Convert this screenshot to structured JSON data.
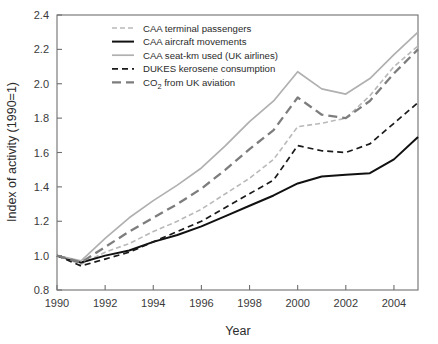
{
  "chart_data": {
    "type": "line",
    "title": "",
    "xlabel": "Year",
    "ylabel": "Index of activity (1990=1)",
    "xlim": [
      1990,
      2005
    ],
    "ylim": [
      0.8,
      2.4
    ],
    "grid": false,
    "legend_position": "top-left",
    "x": [
      1990,
      1991,
      1992,
      1993,
      1994,
      1995,
      1996,
      1997,
      1998,
      1999,
      2000,
      2001,
      2002,
      2003,
      2004,
      2005
    ],
    "xticks": [
      "1990",
      "1992",
      "1994",
      "1996",
      "1998",
      "2000",
      "2002",
      "2004"
    ],
    "xtick_values": [
      1990,
      1992,
      1994,
      1996,
      1998,
      2000,
      2002,
      2004
    ],
    "yticks": [
      "0.8",
      "1.0",
      "1.2",
      "1.4",
      "1.6",
      "1.8",
      "2.0",
      "2.2",
      "2.4"
    ],
    "ytick_values": [
      0.8,
      1.0,
      1.2,
      1.4,
      1.6,
      1.8,
      2.0,
      2.2,
      2.4
    ],
    "series": [
      {
        "name": "CAA terminal passengers",
        "style": "dashed",
        "color": "#b9b9b9",
        "width": 1.6,
        "dash": "5,3",
        "values": [
          1.0,
          0.95,
          1.02,
          1.07,
          1.14,
          1.2,
          1.27,
          1.36,
          1.45,
          1.56,
          1.75,
          1.77,
          1.8,
          1.93,
          2.1,
          2.22
        ]
      },
      {
        "name": "CAA aircraft movements",
        "style": "solid",
        "color": "#111111",
        "width": 2.0,
        "dash": "",
        "values": [
          1.0,
          0.96,
          1.0,
          1.03,
          1.08,
          1.12,
          1.17,
          1.23,
          1.29,
          1.35,
          1.42,
          1.46,
          1.47,
          1.48,
          1.56,
          1.69
        ]
      },
      {
        "name": "CAA seat-km used (UK airlines)",
        "style": "solid",
        "color": "#b0b0b0",
        "width": 1.7,
        "dash": "",
        "values": [
          1.0,
          0.97,
          1.1,
          1.22,
          1.32,
          1.41,
          1.51,
          1.64,
          1.78,
          1.9,
          2.07,
          1.97,
          1.94,
          2.03,
          2.17,
          2.3
        ]
      },
      {
        "name": "DUKES kerosene consumption",
        "style": "dashed",
        "color": "#1a1a1a",
        "width": 1.7,
        "dash": "6,4",
        "values": [
          1.0,
          0.94,
          0.98,
          1.02,
          1.08,
          1.14,
          1.2,
          1.28,
          1.36,
          1.44,
          1.64,
          1.61,
          1.6,
          1.65,
          1.77,
          1.89
        ]
      },
      {
        "name": "CO2 from UK aviation",
        "style": "dashed",
        "color": "#7d7d7d",
        "width": 2.3,
        "dash": "9,5",
        "values": [
          1.0,
          0.96,
          1.05,
          1.14,
          1.22,
          1.3,
          1.39,
          1.5,
          1.62,
          1.73,
          1.92,
          1.82,
          1.8,
          1.9,
          2.06,
          2.2
        ]
      }
    ],
    "legend_entries": [
      "CAA terminal passengers",
      "CAA aircraft movements",
      "CAA seat-km used (UK airlines)",
      "DUKES kerosene consumption",
      "CO2 from UK aviation"
    ]
  },
  "legend": {
    "items": [
      {
        "label": "CAA terminal passengers"
      },
      {
        "label": "CAA aircraft movements"
      },
      {
        "label": "CAA seat-km used (UK airlines)"
      },
      {
        "label": "DUKES kerosene consumption"
      },
      {
        "label": "CO",
        "sub": "2",
        "tail": " from UK aviation"
      }
    ]
  },
  "axes": {
    "x_title": "Year",
    "y_title": "Index of activity (1990=1)"
  }
}
